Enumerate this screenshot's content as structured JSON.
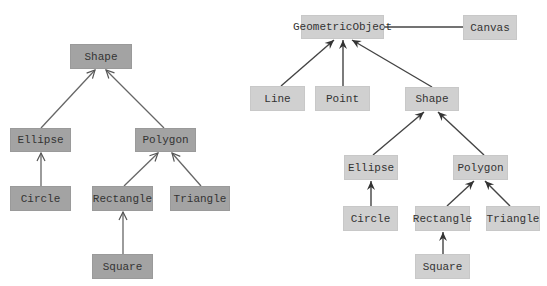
{
  "left_diagram": {
    "fill": "#a3a3a3",
    "arrow_style": "open-triangle",
    "nodes": [
      {
        "id": "shape",
        "label": "Shape",
        "x": 70,
        "y": 44,
        "w": 62,
        "h": 25
      },
      {
        "id": "ellipse",
        "label": "Ellipse",
        "x": 10,
        "y": 128,
        "w": 61,
        "h": 24
      },
      {
        "id": "polygon",
        "label": "Polygon",
        "x": 135,
        "y": 128,
        "w": 61,
        "h": 24
      },
      {
        "id": "circle",
        "label": "Circle",
        "x": 10,
        "y": 186,
        "w": 61,
        "h": 25
      },
      {
        "id": "rectangle",
        "label": "Rectangle",
        "x": 92,
        "y": 186,
        "w": 61,
        "h": 25
      },
      {
        "id": "triangle",
        "label": "Triangle",
        "x": 170,
        "y": 186,
        "w": 60,
        "h": 25
      },
      {
        "id": "square",
        "label": "Square",
        "x": 92,
        "y": 254,
        "w": 61,
        "h": 25
      }
    ]
  },
  "right_diagram": {
    "fill": "#d0d0d0",
    "arrow_style": "filled-arrow",
    "nodes": [
      {
        "id": "geometricobject",
        "label": "GeometricObject",
        "x": 301,
        "y": 15,
        "w": 83,
        "h": 24
      },
      {
        "id": "canvas",
        "label": "Canvas",
        "x": 463,
        "y": 15,
        "w": 54,
        "h": 25
      },
      {
        "id": "line",
        "label": "Line",
        "x": 250,
        "y": 86,
        "w": 55,
        "h": 25
      },
      {
        "id": "point",
        "label": "Point",
        "x": 315,
        "y": 86,
        "w": 55,
        "h": 25
      },
      {
        "id": "shape",
        "label": "Shape",
        "x": 405,
        "y": 87,
        "w": 54,
        "h": 24
      },
      {
        "id": "ellipse",
        "label": "Ellipse",
        "x": 344,
        "y": 155,
        "w": 54,
        "h": 25
      },
      {
        "id": "polygon",
        "label": "Polygon",
        "x": 453,
        "y": 155,
        "w": 55,
        "h": 25
      },
      {
        "id": "circle",
        "label": "Circle",
        "x": 343,
        "y": 206,
        "w": 55,
        "h": 25
      },
      {
        "id": "rectangle",
        "label": "Rectangle",
        "x": 415,
        "y": 206,
        "w": 55,
        "h": 25
      },
      {
        "id": "triangle",
        "label": "Triangle",
        "x": 486,
        "y": 206,
        "w": 54,
        "h": 25
      },
      {
        "id": "square",
        "label": "Square",
        "x": 415,
        "y": 254,
        "w": 55,
        "h": 25
      }
    ]
  }
}
